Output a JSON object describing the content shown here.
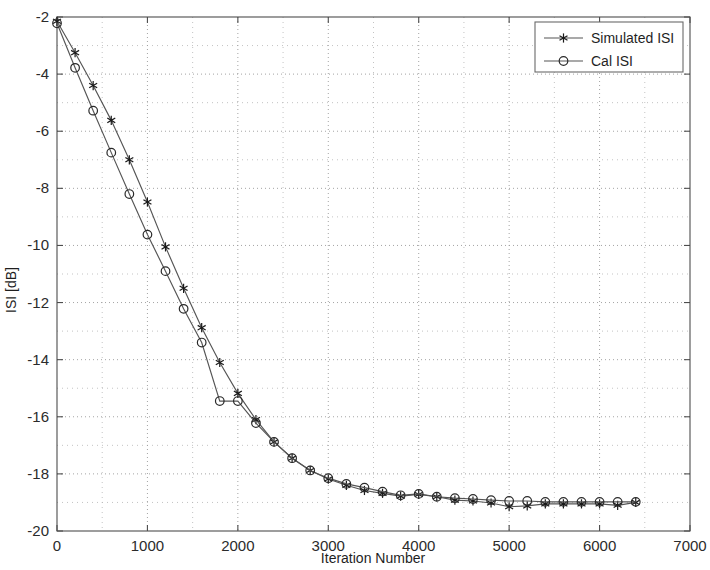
{
  "chart_data": {
    "type": "line",
    "title": "",
    "xlabel": "Iteration Number",
    "ylabel": "ISI [dB]",
    "xlim": [
      0,
      7000
    ],
    "ylim": [
      -20,
      -2
    ],
    "xticks": [
      0,
      1000,
      2000,
      3000,
      4000,
      5000,
      6000,
      7000
    ],
    "yticks": [
      -20,
      -18,
      -16,
      -14,
      -12,
      -10,
      -8,
      -6,
      -4,
      -2
    ],
    "xtick_labels": [
      "0",
      "1000",
      "2000",
      "3000",
      "4000",
      "5000",
      "6000",
      "7000"
    ],
    "ytick_labels": [
      "-20",
      "-18",
      "-16",
      "-14",
      "-12",
      "-10",
      "-8",
      "-6",
      "-4",
      "-2"
    ],
    "grid": true,
    "grid_style": "dotted",
    "legend_position": "top-right",
    "marker_interval": 200,
    "x": [
      0,
      200,
      400,
      600,
      800,
      1000,
      1200,
      1400,
      1600,
      1800,
      2000,
      2200,
      2400,
      2600,
      2800,
      3000,
      3200,
      3400,
      3600,
      3800,
      4000,
      4200,
      4400,
      4600,
      4800,
      5000,
      5200,
      5400,
      5600,
      5800,
      6000,
      6200,
      6400
    ],
    "series": [
      {
        "name": "Simulated ISI",
        "marker": "star",
        "color": "#555555",
        "values": [
          -2.15,
          -3.25,
          -4.4,
          -5.62,
          -7.0,
          -8.48,
          -10.05,
          -11.5,
          -12.88,
          -14.1,
          -15.18,
          -16.1,
          -16.88,
          -17.45,
          -17.88,
          -18.18,
          -18.4,
          -18.58,
          -18.68,
          -18.78,
          -18.72,
          -18.8,
          -18.92,
          -18.95,
          -19.02,
          -19.15,
          -19.12,
          -19.05,
          -19.05,
          -19.05,
          -19.05,
          -19.1,
          -19.0
        ]
      },
      {
        "name": "Cal ISI",
        "marker": "circle",
        "color": "#555555",
        "values": [
          -2.22,
          -3.78,
          -5.28,
          -6.75,
          -8.2,
          -9.62,
          -10.9,
          -12.22,
          -13.4,
          -15.45,
          -15.45,
          -16.22,
          -16.88,
          -17.45,
          -17.88,
          -18.15,
          -18.35,
          -18.48,
          -18.62,
          -18.75,
          -18.7,
          -18.8,
          -18.85,
          -18.88,
          -18.92,
          -18.95,
          -18.95,
          -18.98,
          -18.98,
          -18.98,
          -18.98,
          -18.98,
          -18.98
        ]
      }
    ]
  },
  "legend": {
    "entries": [
      {
        "label": "Simulated ISI"
      },
      {
        "label": "Cal ISI"
      }
    ]
  }
}
